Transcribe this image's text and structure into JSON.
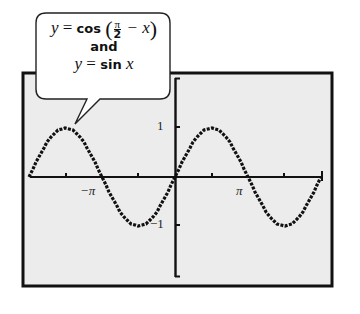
{
  "callout": {
    "line1_lhs": "y",
    "line1_eq": " = ",
    "line1_fn": "cos",
    "line1_frac_num": "π",
    "line1_frac_den": "2",
    "line1_rest": " − x",
    "line2": "and",
    "line3_lhs": "y",
    "line3_eq": " = ",
    "line3_fn": "sin",
    "line3_var": " x"
  },
  "axes": {
    "y_tick_pos_label": "1",
    "y_tick_neg_label": "−1",
    "x_tick_neg_label": "−π",
    "x_tick_pos_label": "π"
  },
  "colors": {
    "plot_bg": "#ececec",
    "frame": "#111111",
    "curve": "#111111"
  },
  "chart_data": {
    "type": "line",
    "xlabel": "",
    "ylabel": "",
    "xlim": [
      -6.2832,
      6.2832
    ],
    "ylim": [
      -1.8,
      2.0
    ],
    "x_ticks": [
      -6.2832,
      -4.7124,
      -3.1416,
      -1.5708,
      0,
      1.5708,
      3.1416,
      4.7124,
      6.2832
    ],
    "x_tick_labels": {
      "-3.1416": "−π",
      "3.1416": "π"
    },
    "y_ticks": [
      -1,
      1
    ],
    "y_tick_labels": [
      "−1",
      "1"
    ],
    "grid": false,
    "legend": "none (callout annotation)",
    "annotations": [
      "y = cos(π/2 − x)",
      "and",
      "y = sin x"
    ],
    "series": [
      {
        "name": "y = sin x (identical to y = cos(π/2 − x))",
        "x": [
          -6.2832,
          -5.4978,
          -4.7124,
          -3.927,
          -3.1416,
          -2.3562,
          -1.5708,
          -0.7854,
          0,
          0.7854,
          1.5708,
          2.3562,
          3.1416,
          3.927,
          4.7124,
          5.4978,
          6.2832
        ],
        "values": [
          0,
          0.707,
          1,
          0.707,
          0,
          -0.707,
          -1,
          -0.707,
          0,
          0.707,
          1,
          0.707,
          0,
          -0.707,
          -1,
          -0.707,
          0
        ]
      }
    ]
  }
}
